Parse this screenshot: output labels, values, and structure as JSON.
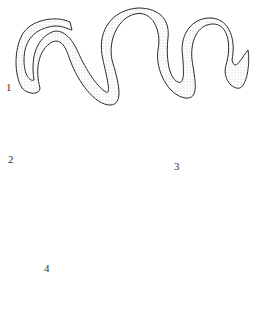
{
  "figure": {
    "labels": [
      {
        "id": "1",
        "text": "1"
      },
      {
        "id": "2",
        "text": "2"
      },
      {
        "id": "3",
        "text": "3"
      },
      {
        "id": "4",
        "text": "4"
      }
    ],
    "colors": {
      "ink": "#2a2a2a",
      "paper": "#ffffff",
      "stipple": "#777777"
    }
  }
}
